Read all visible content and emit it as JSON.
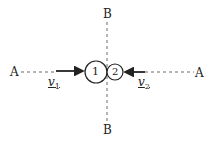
{
  "diagram": {
    "axis_a_label_left": "A",
    "axis_a_label_right": "A",
    "axis_b_label_top": "B",
    "axis_b_label_bottom": "B",
    "ball_1_label": "1",
    "ball_2_label": "2",
    "velocity_1": {
      "symbol": "v",
      "subscript": "1"
    },
    "velocity_2": {
      "symbol": "v",
      "subscript": "2"
    },
    "colors": {
      "stroke": "#222222",
      "background": "#ffffff"
    }
  }
}
